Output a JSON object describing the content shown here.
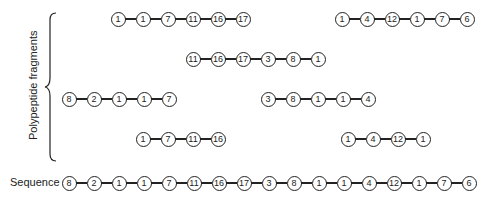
{
  "labels": {
    "fragments": "Polypeptide fragments",
    "sequence": "Sequence"
  },
  "spacing": 25,
  "fragments": [
    {
      "x": 118,
      "y": 19,
      "residues": [
        "1",
        "1",
        "7",
        "11",
        "16",
        "17"
      ]
    },
    {
      "x": 342,
      "y": 19,
      "residues": [
        "1",
        "4",
        "12",
        "1",
        "7",
        "6"
      ]
    },
    {
      "x": 193,
      "y": 59,
      "residues": [
        "11",
        "16",
        "17",
        "3",
        "8",
        "1"
      ]
    },
    {
      "x": 69,
      "y": 99,
      "residues": [
        "8",
        "2",
        "1",
        "1",
        "7"
      ]
    },
    {
      "x": 268,
      "y": 99,
      "residues": [
        "3",
        "8",
        "1",
        "1",
        "4"
      ]
    },
    {
      "x": 143,
      "y": 139,
      "residues": [
        "1",
        "7",
        "11",
        "16"
      ]
    },
    {
      "x": 348,
      "y": 139,
      "residues": [
        "1",
        "4",
        "12",
        "1"
      ]
    }
  ],
  "sequence": {
    "x": 69,
    "y": 183,
    "residues": [
      "8",
      "2",
      "1",
      "1",
      "7",
      "11",
      "16",
      "17",
      "3",
      "8",
      "1",
      "1",
      "4",
      "12",
      "1",
      "7",
      "6"
    ]
  }
}
